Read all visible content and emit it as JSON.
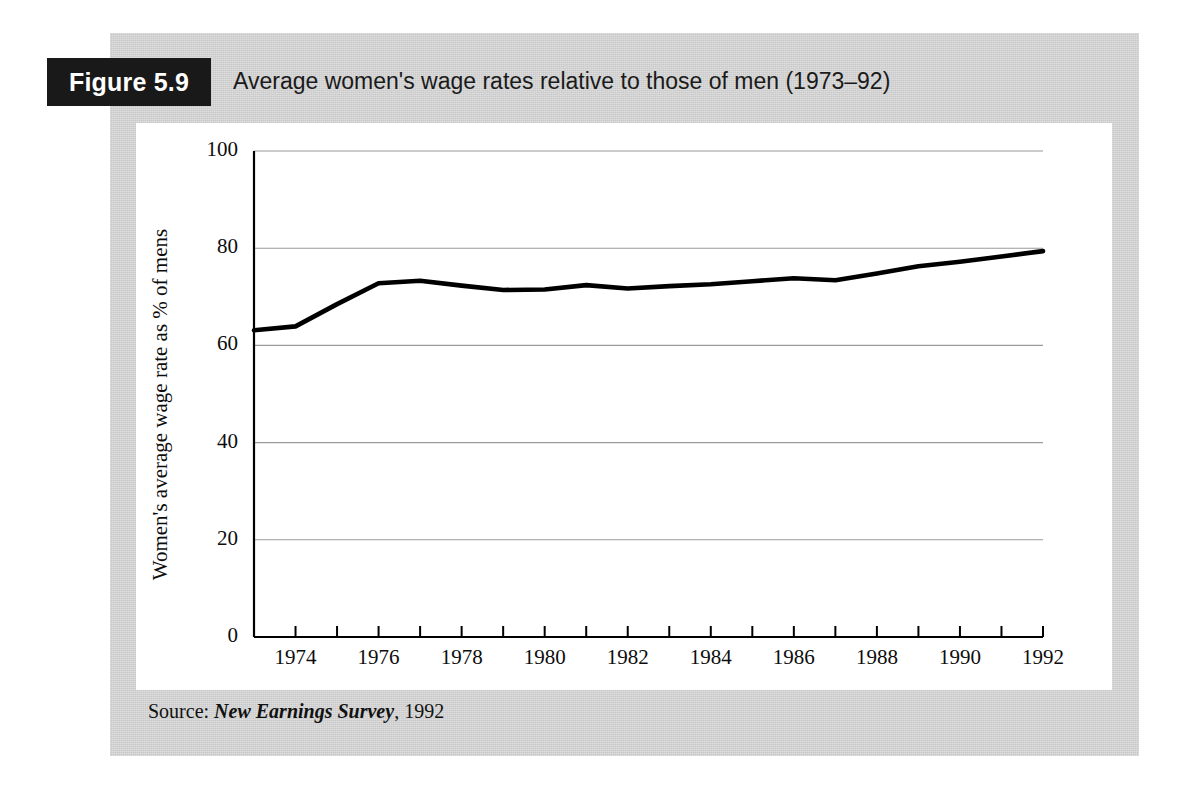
{
  "figure": {
    "badge_label": "Figure 5.9",
    "caption": "Average women's wage rates relative to those of men (1973–92)",
    "source_prefix": "Source:",
    "source_title": "New Earnings Survey",
    "source_year": ", 1992"
  },
  "colors": {
    "mount": "#c9c9c9",
    "badge": "#191919",
    "badge_text": "#ffffff",
    "card": "#ffffff",
    "axis": "#000000",
    "gridline": "#9a9a9a",
    "series": "#000000"
  },
  "chart_data": {
    "type": "line",
    "title": "Average women's wage rates relative to those of men (1973–92)",
    "xlabel": "",
    "ylabel": "Women's average wage rate as % of mens",
    "xlim": [
      1973,
      1992
    ],
    "ylim": [
      0,
      100
    ],
    "grid": true,
    "legend": null,
    "ytick_labels": [
      "0",
      "20",
      "40",
      "60",
      "80",
      "100"
    ],
    "ytick_values": [
      0,
      20,
      40,
      60,
      80,
      100
    ],
    "xtick_values": [
      1973,
      1974,
      1975,
      1976,
      1977,
      1978,
      1979,
      1980,
      1981,
      1982,
      1983,
      1984,
      1985,
      1986,
      1987,
      1988,
      1989,
      1990,
      1991,
      1992
    ],
    "xtick_labels_shown": [
      "1974",
      "1976",
      "1978",
      "1980",
      "1982",
      "1984",
      "1986",
      "1988",
      "1990",
      "1992"
    ],
    "xtick_labelled_values": [
      1974,
      1976,
      1978,
      1980,
      1982,
      1984,
      1986,
      1988,
      1990,
      1992
    ],
    "series": [
      {
        "name": "Women's average wage rate as % of men's",
        "x": [
          1973,
          1974,
          1975,
          1976,
          1977,
          1978,
          1979,
          1980,
          1981,
          1982,
          1983,
          1984,
          1985,
          1986,
          1987,
          1988,
          1989,
          1990,
          1991,
          1992
        ],
        "values": [
          63.1,
          63.9,
          68.5,
          72.8,
          73.3,
          72.3,
          71.4,
          71.5,
          72.4,
          71.7,
          72.2,
          72.6,
          73.2,
          73.8,
          73.4,
          74.8,
          76.3,
          77.2,
          78.3,
          79.4
        ]
      }
    ]
  }
}
